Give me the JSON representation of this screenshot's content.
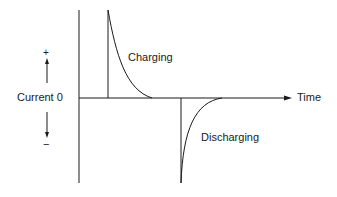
{
  "diagram": {
    "title": "",
    "y_axis_label": "Current 0",
    "y_positive_sign": "+",
    "y_negative_sign": "−",
    "x_axis_label": "Time",
    "curves": [
      {
        "name": "charging",
        "label": "Charging",
        "direction": "positive",
        "shape": "exponential-decay"
      },
      {
        "name": "discharging",
        "label": "Discharging",
        "direction": "negative",
        "shape": "exponential-rise-to-zero"
      }
    ],
    "colors": {
      "line": "#1a1a1a",
      "background": "#ffffff"
    }
  }
}
